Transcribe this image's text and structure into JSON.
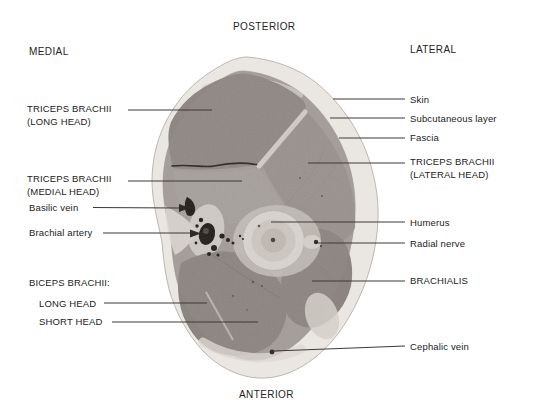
{
  "figure": {
    "type": "anatomical-cross-section"
  },
  "orientation": {
    "top": "POSTERIOR",
    "bottom": "ANTERIOR",
    "left": "MEDIAL",
    "right": "LATERAL"
  },
  "left_labels": [
    {
      "id": "triceps-long-head",
      "text": "TRICEPS BRACHII\n(LONG HEAD)"
    },
    {
      "id": "triceps-medial-head",
      "text": "TRICEPS BRACHII\n(MEDIAL HEAD)"
    },
    {
      "id": "basilic-vein",
      "text": "Basilic vein"
    },
    {
      "id": "brachial-artery",
      "text": "Brachial artery"
    },
    {
      "id": "biceps-brachii",
      "text": "BICEPS BRACHII:"
    },
    {
      "id": "biceps-long-head",
      "text": "LONG HEAD"
    },
    {
      "id": "biceps-short-head",
      "text": "SHORT HEAD"
    }
  ],
  "right_labels": [
    {
      "id": "skin",
      "text": "Skin"
    },
    {
      "id": "subcutaneous-layer",
      "text": "Subcutaneous layer"
    },
    {
      "id": "fascia",
      "text": "Fascia"
    },
    {
      "id": "triceps-lateral-head",
      "text": "TRICEPS BRACHII\n(LATERAL HEAD)"
    },
    {
      "id": "humerus",
      "text": "Humerus"
    },
    {
      "id": "radial-nerve",
      "text": "Radial nerve"
    },
    {
      "id": "brachialis",
      "text": "BRACHIALIS"
    },
    {
      "id": "cephalic-vein",
      "text": "Cephalic vein"
    }
  ],
  "palette": {
    "background": "#ffffff",
    "skin_band": "#eae7e3",
    "muscle_base": "#a39c98",
    "muscle_dark": "#8d8682",
    "bone_outer": "#d9d4ce",
    "bone_inner": "#c0b9b1",
    "vessel_dark": "#1f1b19",
    "leader_line": "#3d3a38",
    "text": "#1b1b1b"
  }
}
